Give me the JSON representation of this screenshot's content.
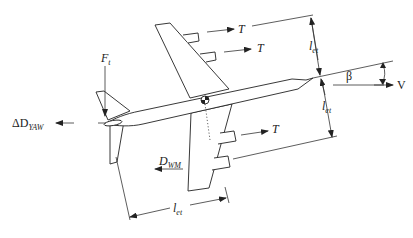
{
  "diagram": {
    "labels": {
      "thrust_top_1": "T",
      "thrust_top_2": "T",
      "thrust_bottom": "T",
      "tail_force_main": "F",
      "tail_force_sub": "t",
      "yaw_drag_prefix": "ΔD",
      "yaw_drag_sub": "YAW",
      "windmill_drag_main": "D",
      "windmill_drag_sub": "WM",
      "arm_upper_main": "l",
      "arm_upper_sub": "et",
      "arm_lower_main": "l",
      "arm_lower_sub": "et",
      "arm_tail_main": "l",
      "arm_tail_sub": "et",
      "sideslip_angle": "β",
      "velocity": "V"
    },
    "elements": [
      "fuselage",
      "upper-wing",
      "lower-wing",
      "vertical-tail",
      "horizontal-tail",
      "engine-1",
      "engine-2",
      "engine-3",
      "engine-4",
      "center-of-gravity"
    ]
  }
}
